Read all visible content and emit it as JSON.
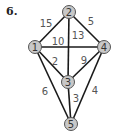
{
  "problem": {
    "number": "6."
  },
  "graph": {
    "nodes": [
      {
        "id": "1",
        "label": "1",
        "x": 35,
        "y": 47
      },
      {
        "id": "2",
        "label": "2",
        "x": 69,
        "y": 12
      },
      {
        "id": "3",
        "label": "3",
        "x": 68,
        "y": 82
      },
      {
        "id": "4",
        "label": "4",
        "x": 104,
        "y": 47
      },
      {
        "id": "5",
        "label": "5",
        "x": 71,
        "y": 124
      }
    ],
    "edges": [
      {
        "from": "1",
        "to": "2",
        "weight": "15",
        "lx": 46,
        "ly": 23
      },
      {
        "from": "2",
        "to": "4",
        "weight": "5",
        "lx": 91,
        "ly": 21
      },
      {
        "from": "2",
        "to": "3",
        "weight": "13",
        "lx": 78,
        "ly": 35
      },
      {
        "from": "1",
        "to": "4",
        "weight": "10",
        "lx": 58,
        "ly": 41
      },
      {
        "from": "1",
        "to": "3",
        "weight": "2",
        "lx": 55,
        "ly": 61
      },
      {
        "from": "3",
        "to": "4",
        "weight": "9",
        "lx": 84,
        "ly": 60
      },
      {
        "from": "1",
        "to": "5",
        "weight": "6",
        "lx": 45,
        "ly": 91
      },
      {
        "from": "3",
        "to": "5",
        "weight": "3",
        "lx": 76,
        "ly": 98
      },
      {
        "from": "4",
        "to": "5",
        "weight": "4",
        "lx": 95,
        "ly": 90
      }
    ]
  }
}
